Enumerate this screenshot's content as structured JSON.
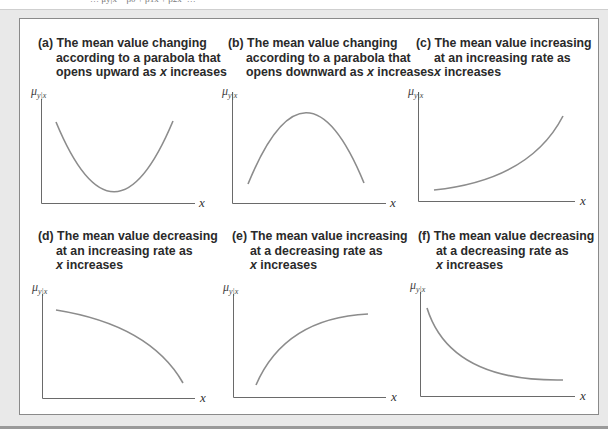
{
  "figure": {
    "top_cut_text": "… μy|x = β0 + β1x + β2x² …",
    "y_axis_label": "μ",
    "y_axis_subscript": "y|x",
    "x_axis_label": "x",
    "colors": {
      "frame": "#e9e9e9",
      "box_border": "#8a8a8a",
      "curve": "#8c8c8c",
      "axis": "#6a6a6a",
      "text": "#2a2a2a"
    },
    "panels": [
      {
        "id": "a",
        "caption_lines": [
          "(a) The mean value changing",
          "according to a parabola that",
          "opens upward as x increases"
        ],
        "shape": "parabola opening upward"
      },
      {
        "id": "b",
        "caption_lines": [
          "(b) The mean value changing",
          "according to a parabola that",
          "opens downward as x increases"
        ],
        "shape": "parabola opening downward"
      },
      {
        "id": "c",
        "caption_lines": [
          "(c) The mean value increasing",
          "at an increasing rate as",
          "x increases"
        ],
        "shape": "increasing convex"
      },
      {
        "id": "d",
        "caption_lines": [
          "(d) The mean value decreasing",
          "at an increasing rate as",
          "x increases"
        ],
        "shape": "decreasing concave"
      },
      {
        "id": "e",
        "caption_lines": [
          "(e) The mean value increasing",
          "at a decreasing rate as",
          "x increases"
        ],
        "shape": "increasing concave"
      },
      {
        "id": "f",
        "caption_lines": [
          "(f) The mean value decreasing",
          "at a decreasing rate as",
          "x increases"
        ],
        "shape": "decreasing convex"
      }
    ]
  }
}
